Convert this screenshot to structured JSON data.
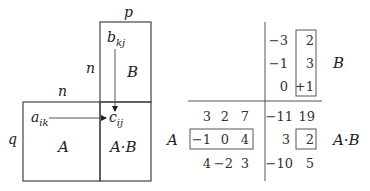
{
  "left_diagram": {
    "dim_labels": {
      "top_p": "p",
      "top_n": "n",
      "left_n": "n",
      "left_q": "q"
    },
    "blocks": {
      "A": "A",
      "B": "B",
      "AB": "A·B"
    },
    "elements": {
      "a": {
        "base": "a",
        "sub": "ik"
      },
      "b": {
        "base": "b",
        "sub": "kj"
      },
      "c": {
        "base": "c",
        "sub": "ij"
      }
    }
  },
  "right_example": {
    "labels": {
      "A": "A",
      "B": "B",
      "AB": "A·B"
    },
    "matrix_B": [
      [
        "−3",
        "2"
      ],
      [
        "−1",
        "3"
      ],
      [
        "0",
        "+1"
      ]
    ],
    "matrix_A": [
      [
        "3",
        "2",
        "7"
      ],
      [
        "−1",
        "0",
        "4"
      ],
      [
        "4",
        "−2",
        "3"
      ]
    ],
    "matrix_AB": [
      [
        "−11",
        "19"
      ],
      [
        "3",
        "2"
      ],
      [
        "−10",
        "5"
      ]
    ],
    "highlight": {
      "A_row": 2,
      "B_col": 2,
      "AB_entry": [
        2,
        2
      ]
    }
  }
}
